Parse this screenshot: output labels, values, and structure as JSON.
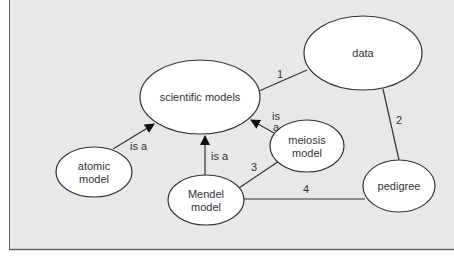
{
  "colors": {
    "background": "#e8e8e8",
    "node_fill": "#ffffff",
    "stroke": "#333333",
    "text": "#333333"
  },
  "nodes": [
    {
      "id": "scientific_models",
      "label_lines": [
        "scientific models"
      ]
    },
    {
      "id": "data",
      "label_lines": [
        "data"
      ]
    },
    {
      "id": "atomic_model",
      "label_lines": [
        "atomic",
        "model"
      ]
    },
    {
      "id": "mendel_model",
      "label_lines": [
        "Mendel",
        "model"
      ]
    },
    {
      "id": "meiosis_model",
      "label_lines": [
        "meiosis",
        "model"
      ]
    },
    {
      "id": "pedigree",
      "label_lines": [
        "pedigree"
      ]
    }
  ],
  "edges": [
    {
      "from": "scientific_models",
      "to": "data",
      "label": "1",
      "arrow": false
    },
    {
      "from": "data",
      "to": "pedigree",
      "label": "2",
      "arrow": false
    },
    {
      "from": "mendel_model",
      "to": "meiosis_model",
      "label": "3",
      "arrow": false
    },
    {
      "from": "mendel_model",
      "to": "pedigree",
      "label": "4",
      "arrow": false
    },
    {
      "from": "atomic_model",
      "to": "scientific_models",
      "label": "is a",
      "arrow": true
    },
    {
      "from": "mendel_model",
      "to": "scientific_models",
      "label": "is a",
      "arrow": true
    },
    {
      "from": "meiosis_model",
      "to": "scientific_models",
      "label_lines": [
        "is",
        "a"
      ],
      "arrow": true
    }
  ]
}
